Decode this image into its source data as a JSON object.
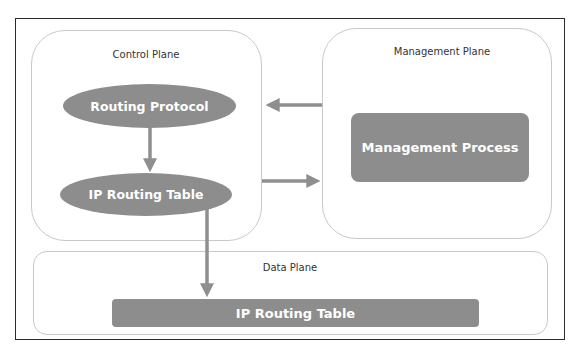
{
  "diagram": {
    "planes": {
      "control": {
        "label": "Control Plane"
      },
      "management": {
        "label": "Management Plane"
      },
      "data": {
        "label": "Data Plane"
      }
    },
    "nodes": {
      "routing_protocol": {
        "label": "Routing Protocol",
        "shape": "ellipse"
      },
      "ip_routing_table_control": {
        "label": "IP Routing Table",
        "shape": "ellipse"
      },
      "management_process": {
        "label": "Management Process",
        "shape": "rounded-rect"
      },
      "ip_routing_table_data": {
        "label": "IP Routing Table",
        "shape": "rounded-rect"
      }
    },
    "edges": [
      {
        "from": "Routing Protocol",
        "to": "IP Routing Table (Control Plane)"
      },
      {
        "from": "Management Plane",
        "to": "Control Plane"
      },
      {
        "from": "Control Plane",
        "to": "Management Plane"
      },
      {
        "from": "IP Routing Table (Control Plane)",
        "to": "IP Routing Table (Data Plane)"
      }
    ],
    "colors": {
      "node_fill": "#8d8d8d",
      "node_text": "#ffffff",
      "arrow": "#8f8f8f",
      "plane_border": "#c9c9c9",
      "frame_border": "#2b2b2b"
    }
  }
}
